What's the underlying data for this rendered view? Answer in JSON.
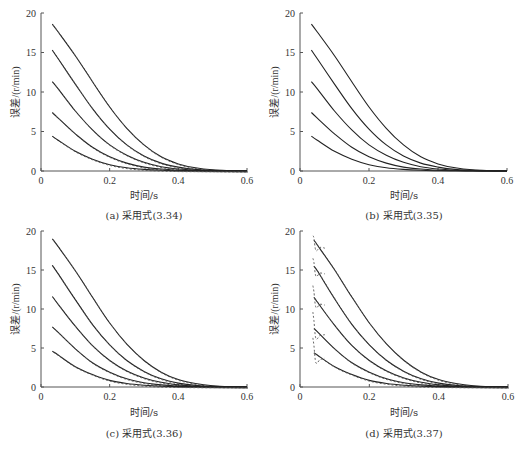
{
  "chart_data": [
    {
      "id": "a",
      "type": "line",
      "title": "",
      "caption": "(a) 采用式(3.34)",
      "xlabel": "时间/s",
      "ylabel": "误差/(r/min)",
      "xlim": [
        0,
        0.6
      ],
      "ylim": [
        0,
        20
      ],
      "xticks": [
        "0",
        "0.2",
        "0.4",
        "0.6"
      ],
      "yticks": [
        "0",
        "5",
        "10",
        "15",
        "20"
      ],
      "grid": false,
      "legend": null,
      "dashed_overlay": true,
      "x": [
        0.033,
        0.05,
        0.1,
        0.15,
        0.2,
        0.25,
        0.3,
        0.35,
        0.4,
        0.45,
        0.5,
        0.55,
        0.6
      ],
      "series": [
        {
          "name": "curve-1",
          "values": [
            18.6,
            17.6,
            14.6,
            11.3,
            8.1,
            5.4,
            3.3,
            1.8,
            0.9,
            0.4,
            0.15,
            0.05,
            0.0
          ]
        },
        {
          "name": "curve-2",
          "values": [
            15.3,
            14.2,
            11.0,
            7.9,
            5.3,
            3.3,
            1.9,
            1.0,
            0.5,
            0.2,
            0.08,
            0.02,
            0.0
          ]
        },
        {
          "name": "curve-3",
          "values": [
            11.3,
            10.4,
            7.6,
            5.2,
            3.3,
            2.0,
            1.1,
            0.55,
            0.25,
            0.1,
            0.04,
            0.01,
            0.0
          ]
        },
        {
          "name": "curve-4",
          "values": [
            7.4,
            6.7,
            4.7,
            3.0,
            1.8,
            1.0,
            0.5,
            0.25,
            0.1,
            0.04,
            0.02,
            0.0,
            0.0
          ]
        },
        {
          "name": "curve-5",
          "values": [
            4.4,
            3.9,
            2.5,
            1.5,
            0.8,
            0.4,
            0.2,
            0.1,
            0.04,
            0.02,
            0.0,
            0.0,
            0.0
          ]
        }
      ]
    },
    {
      "id": "b",
      "type": "line",
      "title": "",
      "caption": "(b) 采用式(3.35)",
      "xlabel": "时间/s",
      "ylabel": "误差/(r/min)",
      "xlim": [
        0,
        0.6
      ],
      "ylim": [
        0,
        20
      ],
      "xticks": [
        "0",
        "0.2",
        "0.4",
        "0.6"
      ],
      "yticks": [
        "0",
        "5",
        "10",
        "15",
        "20"
      ],
      "grid": false,
      "legend": null,
      "dashed_overlay": false,
      "x": [
        0.033,
        0.05,
        0.1,
        0.15,
        0.2,
        0.25,
        0.3,
        0.35,
        0.4,
        0.45,
        0.5,
        0.55,
        0.6
      ],
      "series": [
        {
          "name": "curve-1",
          "values": [
            18.6,
            17.6,
            14.6,
            11.3,
            8.1,
            5.4,
            3.3,
            1.8,
            0.9,
            0.4,
            0.15,
            0.05,
            0.0
          ]
        },
        {
          "name": "curve-2",
          "values": [
            15.3,
            14.2,
            11.0,
            7.9,
            5.3,
            3.3,
            1.9,
            1.0,
            0.5,
            0.2,
            0.08,
            0.02,
            0.0
          ]
        },
        {
          "name": "curve-3",
          "values": [
            11.3,
            10.4,
            7.6,
            5.2,
            3.3,
            2.0,
            1.1,
            0.55,
            0.25,
            0.1,
            0.04,
            0.01,
            0.0
          ]
        },
        {
          "name": "curve-4",
          "values": [
            7.4,
            6.7,
            4.7,
            3.0,
            1.8,
            1.0,
            0.5,
            0.25,
            0.1,
            0.04,
            0.02,
            0.0,
            0.0
          ]
        },
        {
          "name": "curve-5",
          "values": [
            4.4,
            3.9,
            2.5,
            1.5,
            0.8,
            0.4,
            0.2,
            0.1,
            0.04,
            0.02,
            0.0,
            0.0,
            0.0
          ]
        }
      ]
    },
    {
      "id": "c",
      "type": "line",
      "title": "",
      "caption": "(c) 采用式(3.36)",
      "xlabel": "时间/s",
      "ylabel": "误差/(r/min)",
      "xlim": [
        0,
        0.6
      ],
      "ylim": [
        0,
        20
      ],
      "xticks": [
        "0",
        "0.2",
        "0.4",
        "0.6"
      ],
      "yticks": [
        "0",
        "5",
        "10",
        "15",
        "20"
      ],
      "grid": false,
      "legend": null,
      "dashed_overlay": true,
      "x": [
        0.033,
        0.05,
        0.1,
        0.15,
        0.2,
        0.25,
        0.3,
        0.35,
        0.4,
        0.45,
        0.5,
        0.55,
        0.6
      ],
      "series": [
        {
          "name": "curve-1",
          "values": [
            19.0,
            18.0,
            14.9,
            11.5,
            8.2,
            5.5,
            3.4,
            1.9,
            0.95,
            0.45,
            0.17,
            0.05,
            0.0
          ]
        },
        {
          "name": "curve-2",
          "values": [
            15.6,
            14.5,
            11.2,
            8.0,
            5.4,
            3.4,
            2.0,
            1.05,
            0.5,
            0.2,
            0.08,
            0.02,
            0.0
          ]
        },
        {
          "name": "curve-3",
          "values": [
            11.6,
            10.6,
            7.8,
            5.3,
            3.4,
            2.05,
            1.15,
            0.6,
            0.27,
            0.1,
            0.04,
            0.01,
            0.0
          ]
        },
        {
          "name": "curve-4",
          "values": [
            7.7,
            7.0,
            4.9,
            3.1,
            1.9,
            1.05,
            0.55,
            0.27,
            0.12,
            0.05,
            0.02,
            0.0,
            0.0
          ]
        },
        {
          "name": "curve-5",
          "values": [
            4.6,
            4.1,
            2.6,
            1.6,
            0.85,
            0.45,
            0.22,
            0.1,
            0.05,
            0.02,
            0.0,
            0.0,
            0.0
          ]
        }
      ]
    },
    {
      "id": "d",
      "type": "line",
      "title": "",
      "caption": "(d) 采用式(3.37)",
      "xlabel": "时间/s",
      "ylabel": "误差/(r/min)",
      "xlim": [
        0,
        0.6
      ],
      "ylim": [
        0,
        20
      ],
      "xticks": [
        "0",
        "0.2",
        "0.4",
        "0.6"
      ],
      "yticks": [
        "0",
        "5",
        "10",
        "15",
        "20"
      ],
      "grid": false,
      "legend": null,
      "dashed_overlay": true,
      "dashed_initial_spike": [
        19.4,
        16.5,
        13.0,
        9.6,
        6.3
      ],
      "x": [
        0.04,
        0.05,
        0.1,
        0.15,
        0.2,
        0.25,
        0.3,
        0.35,
        0.4,
        0.45,
        0.5,
        0.55,
        0.6
      ],
      "series": [
        {
          "name": "curve-1",
          "values": [
            18.8,
            18.2,
            15.0,
            11.5,
            8.2,
            5.5,
            3.4,
            1.9,
            0.95,
            0.45,
            0.17,
            0.05,
            0.0
          ]
        },
        {
          "name": "curve-2",
          "values": [
            15.5,
            14.9,
            11.3,
            8.0,
            5.4,
            3.4,
            2.0,
            1.05,
            0.5,
            0.2,
            0.08,
            0.02,
            0.0
          ]
        },
        {
          "name": "curve-3",
          "values": [
            11.5,
            10.9,
            7.9,
            5.3,
            3.4,
            2.05,
            1.15,
            0.6,
            0.27,
            0.1,
            0.04,
            0.01,
            0.0
          ]
        },
        {
          "name": "curve-4",
          "values": [
            7.5,
            7.1,
            4.9,
            3.1,
            1.9,
            1.05,
            0.55,
            0.27,
            0.12,
            0.05,
            0.02,
            0.0,
            0.0
          ]
        },
        {
          "name": "curve-5",
          "values": [
            4.4,
            4.1,
            2.6,
            1.6,
            0.85,
            0.45,
            0.22,
            0.1,
            0.05,
            0.02,
            0.0,
            0.0,
            0.0
          ]
        }
      ]
    }
  ],
  "layout": {
    "panels": [
      {
        "left": 41,
        "top": 13,
        "width": 206,
        "height": 158,
        "xlabel_top": 187,
        "caption_top": 207,
        "label_left": 0
      },
      {
        "left": 300,
        "top": 13,
        "width": 207,
        "height": 158,
        "xlabel_top": 187,
        "caption_top": 207,
        "label_left": 260
      },
      {
        "left": 41,
        "top": 231,
        "width": 206,
        "height": 156,
        "xlabel_top": 404,
        "caption_top": 425,
        "label_left": 0
      },
      {
        "left": 300,
        "top": 231,
        "width": 208,
        "height": 156,
        "xlabel_top": 404,
        "caption_top": 425,
        "label_left": 260
      }
    ],
    "line_color": "#222222",
    "axis_color": "#555555"
  }
}
